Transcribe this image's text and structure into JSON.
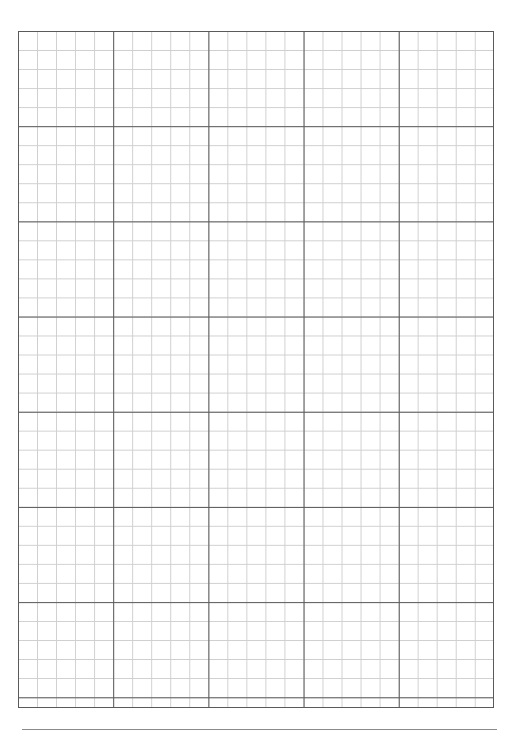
{
  "page": {
    "width_px": 517,
    "height_px": 737,
    "background_color": "#ffffff",
    "content_text": ""
  },
  "grid": {
    "label": "graph-paper-grid",
    "left_px": 18,
    "top_px": 31,
    "width_px": 476,
    "height_px": 677,
    "minor_cell_px": 19.04,
    "major_cell_px": 95.2,
    "minor_cells_per_major": 5,
    "minor_columns": 25,
    "minor_rows": 35.6,
    "major_columns": 5,
    "major_rows": 7,
    "minor_line_color": "#cfcfcf",
    "major_line_color": "#5a5a5a",
    "border_color": "#5a5a5a",
    "fill_color": "#ffffff",
    "major_column_x_px": [
      18,
      113,
      208,
      303,
      398,
      494
    ],
    "major_row_y_px": [
      31,
      126,
      221,
      317,
      412,
      507,
      613,
      708
    ]
  },
  "footer": {
    "rule_label": "footer-horizontal-rule",
    "left_px": 22,
    "top_px": 729,
    "width_px": 475,
    "color": "#8a8a8a"
  }
}
